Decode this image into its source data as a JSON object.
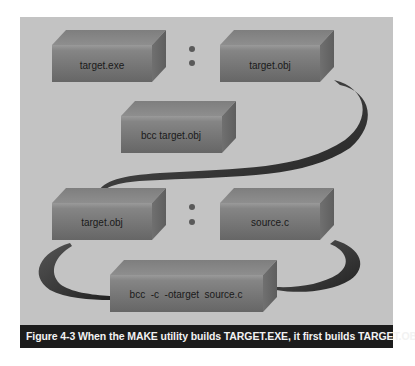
{
  "figure": {
    "caption": "Figure 4-3 When the MAKE utility builds TARGET.EXE, it first builds TARGET.OBJ",
    "colors": {
      "panel_background": "#c3c3c3",
      "box_front": "#7a7a7a",
      "box_top": "#8c8c8c",
      "box_side": "#6a6a6a",
      "arrow": "#3a3a3a",
      "caption_background": "#1c1c1c",
      "caption_text": "#f2f2f2"
    }
  },
  "rules": [
    {
      "target": "target.exe",
      "separator": ":",
      "dependency": "target.obj",
      "command": "bcc  target.obj"
    },
    {
      "target": "target.obj",
      "separator": ":",
      "dependency": "source.c",
      "command": "bcc  -c  -otarget  source.c"
    }
  ],
  "boxes": [
    {
      "id": "box-target-exe",
      "label": "target.exe"
    },
    {
      "id": "box-target-obj-1",
      "label": "target.obj"
    },
    {
      "id": "box-bcc-target-obj",
      "label": "bcc  target.obj"
    },
    {
      "id": "box-target-obj-2",
      "label": "target.obj"
    },
    {
      "id": "box-source-c",
      "label": "source.c"
    },
    {
      "id": "box-bcc-compile",
      "label": "bcc  -c  -otarget  source.c"
    }
  ],
  "separators": [
    ":",
    ":"
  ]
}
